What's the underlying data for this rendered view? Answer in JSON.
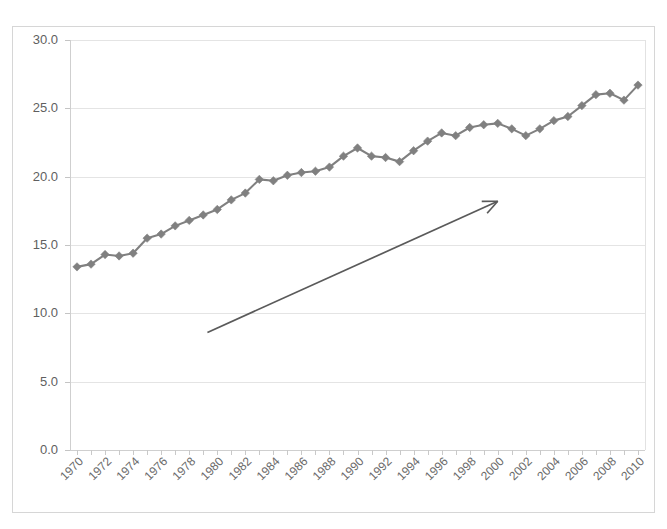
{
  "chart_data": {
    "type": "line",
    "title": "",
    "subtitle": "",
    "xlabel": "",
    "ylabel": "",
    "xlim": [
      1969.5,
      2010.5
    ],
    "ylim": [
      0.0,
      30.0
    ],
    "grid": true,
    "legend": false,
    "legend_position": "none",
    "marker": "diamond",
    "series_color": "#808080",
    "ytick_labels": [
      "0.0",
      "5.0",
      "10.0",
      "15.0",
      "20.0",
      "25.0",
      "30.0"
    ],
    "yticks": [
      0.0,
      5.0,
      10.0,
      15.0,
      20.0,
      25.0,
      30.0
    ],
    "xtick_labels": [
      "1970",
      "1972",
      "1974",
      "1976",
      "1978",
      "1980",
      "1982",
      "1984",
      "1986",
      "1988",
      "1990",
      "1992",
      "1994",
      "1996",
      "1998",
      "2000",
      "2002",
      "2004",
      "2006",
      "2008",
      "2010"
    ],
    "xticks": [
      1970,
      1972,
      1974,
      1976,
      1978,
      1980,
      1982,
      1984,
      1986,
      1988,
      1990,
      1992,
      1994,
      1996,
      1998,
      2000,
      2002,
      2004,
      2006,
      2008,
      2010
    ],
    "x": [
      1970,
      1971,
      1972,
      1973,
      1974,
      1975,
      1976,
      1977,
      1978,
      1979,
      1980,
      1981,
      1982,
      1983,
      1984,
      1985,
      1986,
      1987,
      1988,
      1989,
      1990,
      1991,
      1992,
      1993,
      1994,
      1995,
      1996,
      1997,
      1998,
      1999,
      2000,
      2001,
      2002,
      2003,
      2004,
      2005,
      2006,
      2007,
      2008,
      2009,
      2010
    ],
    "values": [
      13.4,
      13.6,
      14.3,
      14.2,
      14.4,
      15.5,
      15.8,
      16.4,
      16.8,
      17.2,
      17.6,
      18.3,
      18.8,
      19.8,
      19.7,
      20.1,
      20.3,
      20.4,
      20.7,
      21.5,
      22.1,
      21.5,
      21.4,
      21.1,
      21.9,
      22.6,
      23.2,
      23.0,
      23.6,
      23.8,
      23.9,
      23.5,
      23.0,
      23.5,
      24.1,
      24.4,
      25.2,
      26.0,
      26.1,
      25.6,
      26.7
    ],
    "annotations": [
      {
        "type": "arrow",
        "name": "trend-arrow",
        "label": "",
        "x_start": 1979.3,
        "y_start": 8.6,
        "x_end": 2000.0,
        "y_end": 18.2,
        "color": "#5a5a5a"
      }
    ]
  }
}
